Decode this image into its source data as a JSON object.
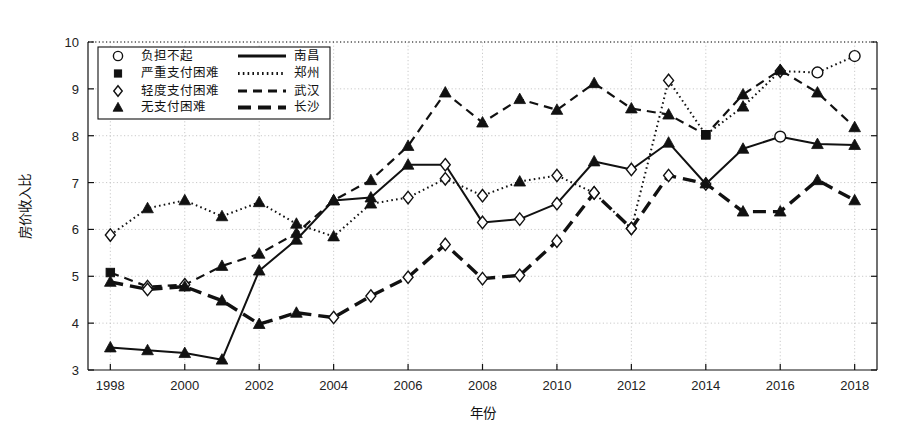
{
  "chart_data": {
    "type": "line",
    "title": "",
    "xlabel": "年份",
    "ylabel": "房价收入比",
    "xlim": [
      1997.4,
      2018.6
    ],
    "ylim": [
      3,
      10
    ],
    "grid": true,
    "x_ticks": [
      1998,
      2000,
      2002,
      2004,
      2006,
      2008,
      2010,
      2012,
      2014,
      2016,
      2018
    ],
    "y_ticks": [
      3,
      4,
      5,
      6,
      7,
      8,
      9,
      10
    ],
    "x": [
      1998,
      1999,
      2000,
      2001,
      2002,
      2003,
      2004,
      2005,
      2006,
      2007,
      2008,
      2009,
      2010,
      2011,
      2012,
      2013,
      2014,
      2015,
      2016,
      2017,
      2018
    ],
    "legend_position": "top-left",
    "marker_legend": [
      {
        "key": "circle",
        "label": "负担不起",
        "icon": "circle-marker"
      },
      {
        "key": "square",
        "label": "严重支付困难",
        "icon": "square-marker"
      },
      {
        "key": "diamond",
        "label": "轻度支付困难",
        "icon": "diamond-marker"
      },
      {
        "key": "triangle",
        "label": "无支付困难",
        "icon": "triangle-marker"
      }
    ],
    "series": [
      {
        "name": "南昌",
        "line_style": "solid",
        "values": [
          3.48,
          3.42,
          3.36,
          3.22,
          5.12,
          5.78,
          6.62,
          6.68,
          7.38,
          7.38,
          6.15,
          6.22,
          6.55,
          7.45,
          7.28,
          7.85,
          6.97,
          7.72,
          7.98,
          7.82,
          7.8
        ],
        "markers": [
          "triangle",
          "triangle",
          "triangle",
          "triangle",
          "triangle",
          "triangle",
          "triangle",
          "triangle",
          "triangle",
          "diamond",
          "diamond",
          "diamond",
          "diamond",
          "triangle",
          "diamond",
          "triangle",
          "diamond",
          "triangle",
          "circle",
          "triangle",
          "triangle"
        ]
      },
      {
        "name": "郑州",
        "line_style": "dotted",
        "values": [
          5.88,
          6.45,
          6.62,
          6.28,
          6.58,
          6.12,
          5.85,
          6.55,
          6.68,
          7.08,
          6.72,
          7.02,
          7.15,
          6.78,
          6.02,
          9.18,
          8.02,
          8.62,
          9.38,
          9.35,
          9.7
        ],
        "markers": [
          "diamond",
          "triangle",
          "triangle",
          "triangle",
          "triangle",
          "triangle",
          "triangle",
          "triangle",
          "diamond",
          "diamond",
          "diamond",
          "triangle",
          "diamond",
          "diamond",
          "diamond",
          "diamond",
          "square",
          "triangle",
          "diamond",
          "circle",
          "circle"
        ]
      },
      {
        "name": "武汉",
        "line_style": "dashed",
        "values": [
          5.08,
          4.78,
          4.82,
          5.22,
          5.48,
          5.92,
          6.62,
          7.05,
          7.78,
          8.92,
          8.28,
          8.78,
          8.55,
          9.12,
          8.58,
          8.45,
          8.02,
          8.88,
          9.4,
          8.92,
          8.18
        ],
        "markers": [
          "square",
          "diamond",
          "diamond",
          "triangle",
          "triangle",
          "triangle",
          "triangle",
          "triangle",
          "triangle",
          "triangle",
          "triangle",
          "triangle",
          "triangle",
          "triangle",
          "triangle",
          "triangle",
          "square",
          "triangle",
          "triangle",
          "triangle",
          "triangle"
        ]
      },
      {
        "name": "长沙",
        "line_style": "thick-dashed",
        "values": [
          4.88,
          4.72,
          4.78,
          4.48,
          3.98,
          4.22,
          4.12,
          4.58,
          4.98,
          5.68,
          4.95,
          5.02,
          5.75,
          6.78,
          6.02,
          7.15,
          6.98,
          6.38,
          6.38,
          7.05,
          6.62
        ],
        "markers": [
          "triangle",
          "diamond",
          "triangle",
          "triangle",
          "triangle",
          "triangle",
          "diamond",
          "diamond",
          "diamond",
          "diamond",
          "diamond",
          "diamond",
          "diamond",
          "diamond",
          "diamond",
          "diamond",
          "triangle",
          "triangle",
          "triangle",
          "triangle",
          "triangle"
        ]
      }
    ]
  }
}
